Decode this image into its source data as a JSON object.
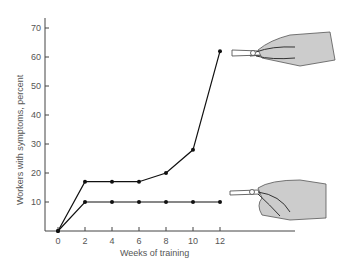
{
  "chart_data": {
    "type": "line",
    "title": "",
    "xlabel": "Weeks of training",
    "ylabel": "Workers with symptoms, percent",
    "x": [
      0,
      2,
      4,
      6,
      8,
      10,
      12
    ],
    "x_ticks": [
      "0",
      "2",
      "4",
      "6",
      "8",
      "10",
      "12"
    ],
    "y_ticks": [
      "10",
      "20",
      "30",
      "40",
      "50",
      "60",
      "70"
    ],
    "ylim": [
      0,
      72
    ],
    "xlim": [
      -1,
      13
    ],
    "grid": false,
    "series": [
      {
        "name": "Conventional pliers (straight handle)",
        "values": [
          0,
          17,
          17,
          17,
          20,
          28,
          62
        ]
      },
      {
        "name": "Bent-handle pliers",
        "values": [
          0,
          10,
          10,
          10,
          10,
          10,
          10
        ]
      }
    ],
    "annotations": [
      "hand-with-straight-pliers illustration beside upper curve",
      "hand-with-bent-pliers illustration beside lower curve"
    ]
  }
}
